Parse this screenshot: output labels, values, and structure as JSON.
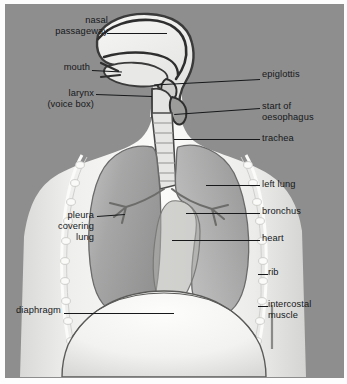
{
  "figure": {
    "background_color": "#8e8e8e",
    "body_color": "#f2f2f0",
    "lung_color": "#9a9a9a",
    "outline_color": "#4a4a4a",
    "label_color": "#16181a",
    "frame_border_color": "#8d8d8d"
  },
  "labels": {
    "nasal_passageway": "nasal\npassageway",
    "mouth": "mouth",
    "larynx": "larynx\n(voice box)",
    "epiglottis": "epiglottis",
    "oesophagus": "start of\noesophagus",
    "trachea": "trachea",
    "left_lung": "left lung",
    "bronchus": "bronchus",
    "heart": "heart",
    "rib": "rib",
    "intercostal": "intercostal\nmuscle",
    "pleura": "pleura\ncovering\nlung",
    "diaphragm": "diaphragm"
  },
  "structures": [
    {
      "name": "nasal-passageway",
      "side": "left"
    },
    {
      "name": "mouth",
      "side": "left"
    },
    {
      "name": "larynx",
      "side": "left"
    },
    {
      "name": "pleura-covering-lung",
      "side": "left"
    },
    {
      "name": "diaphragm",
      "side": "left"
    },
    {
      "name": "epiglottis",
      "side": "right"
    },
    {
      "name": "start-of-oesophagus",
      "side": "right"
    },
    {
      "name": "trachea",
      "side": "right"
    },
    {
      "name": "left-lung",
      "side": "right"
    },
    {
      "name": "bronchus",
      "side": "right"
    },
    {
      "name": "heart",
      "side": "right"
    },
    {
      "name": "rib",
      "side": "right"
    },
    {
      "name": "intercostal-muscle",
      "side": "right"
    }
  ]
}
